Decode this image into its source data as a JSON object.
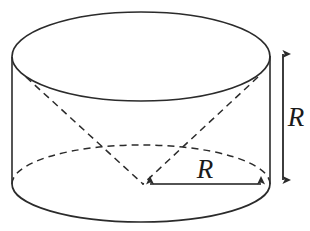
{
  "figure": {
    "kind": "geometry-diagram",
    "background_color": "#ffffff",
    "stroke_color": "#2b2b2b",
    "dashed_stroke_color": "#2b2b2b",
    "label_color": "#1a1a1a",
    "width": 310,
    "height": 231
  },
  "labels": {
    "radius": "R",
    "height": "R"
  },
  "geometry": {
    "top_ellipse": {
      "cx": 141,
      "cy": 57,
      "rx": 129,
      "ry": 45,
      "style": "solid"
    },
    "bottom_ellipse": {
      "cx": 141,
      "cy": 184,
      "rx": 128,
      "ry": 38,
      "front_style": "solid",
      "back_style": "dashed"
    },
    "left_wall": {
      "x": 12,
      "y1": 57,
      "y2": 184
    },
    "right_wall": {
      "x": 270,
      "y1": 56,
      "y2": 184
    },
    "cone_apex": {
      "x": 143,
      "y": 184
    },
    "cone_edge_left": {
      "x": 26,
      "y": 77
    },
    "cone_edge_right": {
      "x": 258,
      "y": 77
    }
  },
  "dimensions": {
    "radius_arrow": {
      "label": "R",
      "x_start": 143,
      "x_end": 268,
      "y": 184,
      "orientation": "horizontal",
      "arrowheads": "both",
      "label_x": 205,
      "label_y": 172
    },
    "height_arrow": {
      "label": "R",
      "x": 283,
      "y_start": 47,
      "y_end": 187,
      "orientation": "vertical",
      "arrowheads": "both",
      "label_x": 296,
      "label_y": 120
    }
  }
}
